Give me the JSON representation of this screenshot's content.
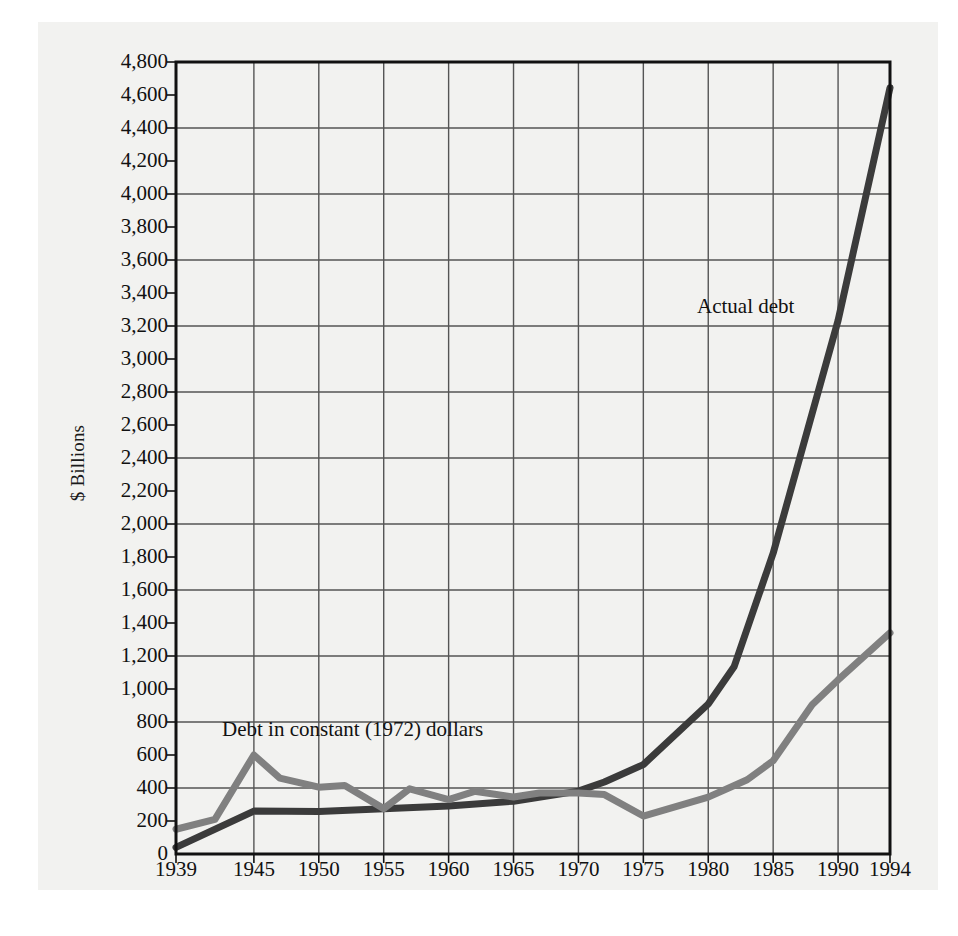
{
  "figure": {
    "ylabel": "$ Billions",
    "background_color": "#f2f2f0",
    "page_color": "#ffffff"
  },
  "annotations": {
    "actual": "Actual debt",
    "constant": "Debt in constant (1972) dollars"
  },
  "chart_data": {
    "type": "line",
    "title": "",
    "xlabel": "",
    "ylabel": "$ Billions",
    "xlim": [
      1939,
      1994
    ],
    "ylim": [
      0,
      4800
    ],
    "ytick_step": 200,
    "grid": true,
    "grid_y_step": 400,
    "grid_x_at_ticks": true,
    "legend": "inline-annotations",
    "xtick_labels": [
      "1939",
      "1945",
      "1950",
      "1955",
      "1960",
      "1965",
      "1970",
      "1975",
      "1980",
      "1985",
      "1990",
      "1994"
    ],
    "xtick_values": [
      1939,
      1945,
      1950,
      1955,
      1960,
      1965,
      1970,
      1975,
      1980,
      1985,
      1990,
      1994
    ],
    "ytick_labels": [
      "0",
      "200",
      "400",
      "600",
      "800",
      "1,000",
      "1,200",
      "1,400",
      "1,600",
      "1,800",
      "2,000",
      "2,200",
      "2,400",
      "2,600",
      "2,800",
      "3,000",
      "3,200",
      "3,400",
      "3,600",
      "3,800",
      "4,000",
      "4,200",
      "4,400",
      "4,600",
      "4,800"
    ],
    "ytick_values": [
      0,
      200,
      400,
      600,
      800,
      1000,
      1200,
      1400,
      1600,
      1800,
      2000,
      2200,
      2400,
      2600,
      2800,
      3000,
      3200,
      3400,
      3600,
      3800,
      4000,
      4200,
      4400,
      4600,
      4800
    ],
    "series": [
      {
        "name": "Actual debt",
        "color": "#3b3b3b",
        "linewidth": 7,
        "x": [
          1939,
          1945,
          1950,
          1955,
          1960,
          1965,
          1970,
          1972,
          1975,
          1980,
          1982,
          1985,
          1990,
          1994
        ],
        "values": [
          40,
          260,
          257,
          274,
          291,
          320,
          381,
          436,
          542,
          909,
          1137,
          1823,
          3233,
          4644
        ]
      },
      {
        "name": "Debt in constant (1972) dollars",
        "color": "#808080",
        "linewidth": 7,
        "x": [
          1939,
          1942,
          1945,
          1947,
          1950,
          1952,
          1955,
          1957,
          1960,
          1962,
          1965,
          1967,
          1970,
          1972,
          1975,
          1980,
          1983,
          1985,
          1988,
          1990,
          1994
        ],
        "values": [
          150,
          210,
          600,
          460,
          405,
          415,
          275,
          395,
          330,
          380,
          345,
          370,
          370,
          360,
          230,
          345,
          450,
          565,
          905,
          1055,
          1340
        ]
      }
    ]
  }
}
